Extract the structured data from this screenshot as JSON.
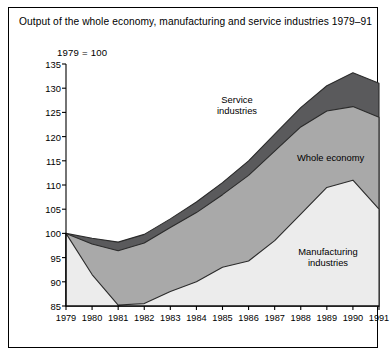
{
  "figure": {
    "title": "Output of the whole economy, manufacturing and service industries 1979–91",
    "subtitle": "1979 = 100"
  },
  "labels": {
    "service": "Service\nindustries",
    "service_line1": "Service",
    "service_line2": "industries",
    "whole": "Whole economy",
    "manufacturing_line1": "Manufacturing",
    "manufacturing_line2": "industries"
  },
  "colors": {
    "service_band": "#5a5a5c",
    "whole_band": "#a9a9a9",
    "manufacturing_band": "#ececec",
    "outline": "#2b2b2b",
    "axis": "#000000",
    "background": "#ffffff"
  },
  "chart_data": {
    "type": "area",
    "title": "Output of the whole economy, manufacturing and service industries 1979–91",
    "subtitle": "1979 = 100",
    "xlabel": "",
    "ylabel": "",
    "xlim": [
      1979,
      1991
    ],
    "ylim": [
      85,
      135
    ],
    "ytick_step": 5,
    "grid": false,
    "legend": "inline-annotations",
    "x": [
      1979,
      1980,
      1981,
      1982,
      1983,
      1984,
      1985,
      1986,
      1987,
      1988,
      1989,
      1990,
      1991
    ],
    "categories": [
      "1979",
      "1980",
      "1981",
      "1982",
      "1983",
      "1984",
      "1985",
      "1986",
      "1987",
      "1988",
      "1989",
      "1990",
      "1991"
    ],
    "yticks": [
      85,
      90,
      95,
      100,
      105,
      110,
      115,
      120,
      125,
      130,
      135
    ],
    "series": [
      {
        "name": "Service industries",
        "color": "#5a5a5c",
        "values": [
          100.0,
          99.0,
          98.2,
          99.8,
          103.0,
          106.5,
          110.5,
          115.0,
          120.5,
          126.0,
          130.5,
          133.2,
          131.0
        ]
      },
      {
        "name": "Whole economy",
        "color": "#a9a9a9",
        "values": [
          100.0,
          97.8,
          96.4,
          98.0,
          101.2,
          104.3,
          108.0,
          112.0,
          117.0,
          122.0,
          125.3,
          126.2,
          124.0
        ]
      },
      {
        "name": "Manufacturing industries",
        "color": "#ececec",
        "values": [
          100.0,
          91.5,
          85.2,
          85.5,
          88.0,
          90.0,
          93.0,
          94.3,
          98.5,
          104.0,
          109.5,
          111.0,
          105.0
        ]
      }
    ]
  }
}
